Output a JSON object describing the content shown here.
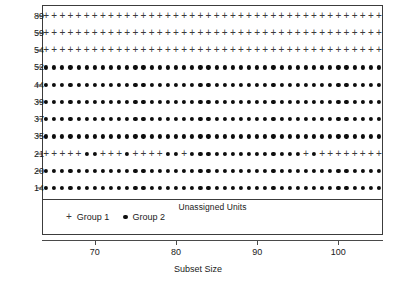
{
  "chart_data": {
    "type": "scatter",
    "title": "",
    "subtitle": "",
    "xlabel": "Subset Size",
    "ylabel": "",
    "panel_label": "Unassigned Units",
    "xlim": [
      63.5,
      105.5
    ],
    "ylim_categories_top_to_bottom": [
      89,
      59,
      54,
      52,
      44,
      39,
      37,
      35,
      21,
      20,
      14
    ],
    "x_ticks": [
      70,
      80,
      90,
      100
    ],
    "x_tick_labels": [
      "70",
      "80",
      "90",
      "100"
    ],
    "y_tick_labels": [
      "89",
      "59",
      "54",
      "52",
      "44",
      "39",
      "37",
      "35",
      "21",
      "20",
      "14"
    ],
    "grid": false,
    "legend_position": "bottom-left",
    "legend": [
      {
        "label": "Group 1",
        "marker": "plus"
      },
      {
        "label": "Group 2",
        "marker": "dot"
      }
    ],
    "x_values": [
      64,
      65,
      66,
      67,
      68,
      69,
      70,
      71,
      72,
      73,
      74,
      75,
      76,
      77,
      78,
      79,
      80,
      81,
      82,
      83,
      84,
      85,
      86,
      87,
      88,
      89,
      90,
      91,
      92,
      93,
      94,
      95,
      96,
      97,
      98,
      99,
      100,
      101,
      102,
      103,
      104,
      105
    ],
    "series": [
      {
        "name": "unit-89",
        "y_label": "89",
        "markers": [
          "plus",
          "plus",
          "plus",
          "plus",
          "plus",
          "plus",
          "plus",
          "plus",
          "plus",
          "plus",
          "plus",
          "plus",
          "plus",
          "plus",
          "plus",
          "plus",
          "plus",
          "plus",
          "plus",
          "plus",
          "plus",
          "plus",
          "plus",
          "plus",
          "plus",
          "plus",
          "plus",
          "plus",
          "plus",
          "plus",
          "plus",
          "plus",
          "plus",
          "plus",
          "plus",
          "plus",
          "plus",
          "plus",
          "plus",
          "plus",
          "plus",
          "plus"
        ]
      },
      {
        "name": "unit-59",
        "y_label": "59",
        "markers": [
          "plus",
          "plus",
          "plus",
          "plus",
          "plus",
          "plus",
          "plus",
          "plus",
          "plus",
          "plus",
          "plus",
          "plus",
          "plus",
          "plus",
          "plus",
          "plus",
          "plus",
          "plus",
          "plus",
          "plus",
          "plus",
          "plus",
          "plus",
          "plus",
          "plus",
          "plus",
          "plus",
          "plus",
          "plus",
          "plus",
          "plus",
          "plus",
          "plus",
          "plus",
          "plus",
          "plus",
          "plus",
          "plus",
          "plus",
          "plus",
          "plus",
          "plus"
        ]
      },
      {
        "name": "unit-54",
        "y_label": "54",
        "markers": [
          "plus",
          "plus",
          "plus",
          "plus",
          "plus",
          "plus",
          "plus",
          "plus",
          "plus",
          "plus",
          "plus",
          "plus",
          "plus",
          "plus",
          "plus",
          "plus",
          "plus",
          "plus",
          "plus",
          "plus",
          "plus",
          "plus",
          "plus",
          "plus",
          "plus",
          "plus",
          "plus",
          "plus",
          "plus",
          "plus",
          "plus",
          "plus",
          "plus",
          "plus",
          "plus",
          "plus",
          "plus",
          "plus",
          "plus",
          "plus",
          "plus",
          "plus"
        ]
      },
      {
        "name": "unit-52",
        "y_label": "52",
        "markers": [
          "dot",
          "dot",
          "dot",
          "dot",
          "dot",
          "dot",
          "dot",
          "dot",
          "dot",
          "dot",
          "dot",
          "dot",
          "dot",
          "dot",
          "dot",
          "dot",
          "dot",
          "dot",
          "dot",
          "dot",
          "dot",
          "dot",
          "dot",
          "dot",
          "dot",
          "dot",
          "dot",
          "dot",
          "dot",
          "dot",
          "dot",
          "dot",
          "dot",
          "dot",
          "dot",
          "dot",
          "dot",
          "dot",
          "dot",
          "dot",
          "dot",
          "dot"
        ]
      },
      {
        "name": "unit-44",
        "y_label": "44",
        "markers": [
          "dot",
          "dot",
          "dot",
          "dot",
          "dot",
          "dot",
          "dot",
          "dot",
          "dot",
          "dot",
          "dot",
          "dot",
          "dot",
          "dot",
          "dot",
          "dot",
          "dot",
          "dot",
          "dot",
          "dot",
          "dot",
          "dot",
          "dot",
          "dot",
          "dot",
          "dot",
          "dot",
          "dot",
          "dot",
          "dot",
          "dot",
          "dot",
          "dot",
          "dot",
          "dot",
          "dot",
          "dot",
          "dot",
          "dot",
          "dot",
          "dot",
          "dot"
        ]
      },
      {
        "name": "unit-39",
        "y_label": "39",
        "markers": [
          "dot",
          "dot",
          "dot",
          "dot",
          "dot",
          "dot",
          "dot",
          "dot",
          "dot",
          "dot",
          "dot",
          "dot",
          "dot",
          "dot",
          "dot",
          "dot",
          "dot",
          "dot",
          "dot",
          "dot",
          "dot",
          "dot",
          "dot",
          "dot",
          "dot",
          "dot",
          "dot",
          "dot",
          "dot",
          "dot",
          "dot",
          "dot",
          "dot",
          "dot",
          "dot",
          "dot",
          "dot",
          "dot",
          "dot",
          "dot",
          "dot",
          "dot"
        ]
      },
      {
        "name": "unit-37",
        "y_label": "37",
        "markers": [
          "dot",
          "dot",
          "dot",
          "dot",
          "dot",
          "dot",
          "dot",
          "dot",
          "dot",
          "dot",
          "dot",
          "dot",
          "dot",
          "dot",
          "dot",
          "dot",
          "dot",
          "dot",
          "dot",
          "dot",
          "dot",
          "dot",
          "dot",
          "dot",
          "dot",
          "dot",
          "dot",
          "dot",
          "dot",
          "dot",
          "dot",
          "dot",
          "dot",
          "dot",
          "dot",
          "dot",
          "dot",
          "dot",
          "dot",
          "dot",
          "dot",
          "dot"
        ]
      },
      {
        "name": "unit-35",
        "y_label": "35",
        "markers": [
          "dot",
          "dot",
          "dot",
          "dot",
          "dot",
          "dot",
          "dot",
          "dot",
          "dot",
          "dot",
          "dot",
          "dot",
          "dot",
          "dot",
          "dot",
          "dot",
          "dot",
          "dot",
          "dot",
          "dot",
          "dot",
          "dot",
          "dot",
          "dot",
          "dot",
          "dot",
          "dot",
          "dot",
          "dot",
          "dot",
          "dot",
          "dot",
          "dot",
          "dot",
          "dot",
          "dot",
          "dot",
          "dot",
          "dot",
          "dot",
          "dot",
          "dot"
        ]
      },
      {
        "name": "unit-21",
        "y_label": "21",
        "markers": [
          "plus",
          "plus",
          "plus",
          "plus",
          "plus",
          "dot",
          "dot",
          "plus",
          "plus",
          "plus",
          "dot",
          "plus",
          "plus",
          "plus",
          "plus",
          "dot",
          "dot",
          "plus",
          "dot",
          "dot",
          "dot",
          "dot",
          "dot",
          "dot",
          "dot",
          "dot",
          "dot",
          "dot",
          "dot",
          "dot",
          "dot",
          "dot",
          "plus",
          "dot",
          "plus",
          "plus",
          "plus",
          "plus",
          "plus",
          "plus",
          "plus",
          "plus"
        ]
      },
      {
        "name": "unit-20",
        "y_label": "20",
        "markers": [
          "dot",
          "dot",
          "dot",
          "dot",
          "dot",
          "dot",
          "dot",
          "dot",
          "dot",
          "dot",
          "dot",
          "dot",
          "dot",
          "dot",
          "dot",
          "dot",
          "dot",
          "dot",
          "dot",
          "dot",
          "dot",
          "dot",
          "dot",
          "dot",
          "dot",
          "dot",
          "dot",
          "dot",
          "dot",
          "dot",
          "dot",
          "dot",
          "dot",
          "dot",
          "dot",
          "dot",
          "dot",
          "dot",
          "dot",
          "dot",
          "dot",
          "dot"
        ]
      },
      {
        "name": "unit-14",
        "y_label": "14",
        "markers": [
          "dot",
          "dot",
          "dot",
          "dot",
          "dot",
          "dot",
          "dot",
          "dot",
          "dot",
          "dot",
          "dot",
          "dot",
          "dot",
          "dot",
          "dot",
          "dot",
          "dot",
          "dot",
          "dot",
          "dot",
          "dot",
          "dot",
          "dot",
          "dot",
          "dot",
          "dot",
          "dot",
          "dot",
          "dot",
          "dot",
          "dot",
          "dot",
          "dot",
          "dot",
          "dot",
          "dot",
          "dot",
          "dot",
          "dot",
          "dot",
          "dot",
          "dot"
        ]
      }
    ]
  },
  "colors": {
    "frame": "#3c3c3c",
    "axis": "#4a4a4a",
    "group1": "#3a3a3a",
    "group2": "#0d0d0d",
    "text": "#1a1a1a",
    "background": "#ffffff"
  },
  "markers": {
    "plus_glyph": "+",
    "dot_glyph": "●"
  }
}
